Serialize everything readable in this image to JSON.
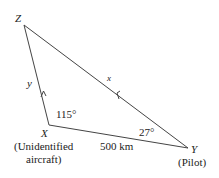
{
  "diagram": {
    "type": "triangle",
    "vertices": {
      "Z": {
        "label": "Z",
        "x": 24,
        "y": 25
      },
      "X": {
        "label": "X",
        "sublabel_line1": "(Unidentified",
        "sublabel_line2": "aircraft)",
        "x": 49,
        "y": 125
      },
      "Y": {
        "label": "Y",
        "sublabel": "(Pilot)",
        "x": 188,
        "y": 148
      }
    },
    "sides": {
      "XZ": {
        "label": "y",
        "arrow": "toward Z"
      },
      "YZ": {
        "label": "x",
        "arrow": "toward Z"
      },
      "XY": {
        "label": "500 km"
      }
    },
    "angles": {
      "X": "115°",
      "Y": "27°"
    },
    "colors": {
      "line": "#444444",
      "text": "#222222",
      "faint_label": "#999999"
    }
  }
}
